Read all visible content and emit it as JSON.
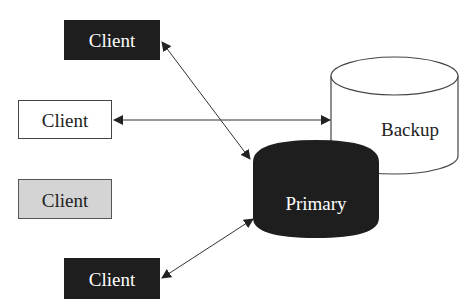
{
  "diagram": {
    "clients": [
      {
        "label": "Client",
        "style": "dark"
      },
      {
        "label": "Client",
        "style": "white"
      },
      {
        "label": "Client",
        "style": "gray"
      },
      {
        "label": "Client",
        "style": "dark"
      }
    ],
    "primary": {
      "label": "Primary"
    },
    "backup": {
      "label": "Backup"
    },
    "colors": {
      "dark_fill": "#1e1e1e",
      "gray_fill": "#d4d4d4",
      "white_fill": "#ffffff",
      "line": "#333333",
      "dark_text": "#ffffff",
      "light_text": "#222222"
    }
  }
}
